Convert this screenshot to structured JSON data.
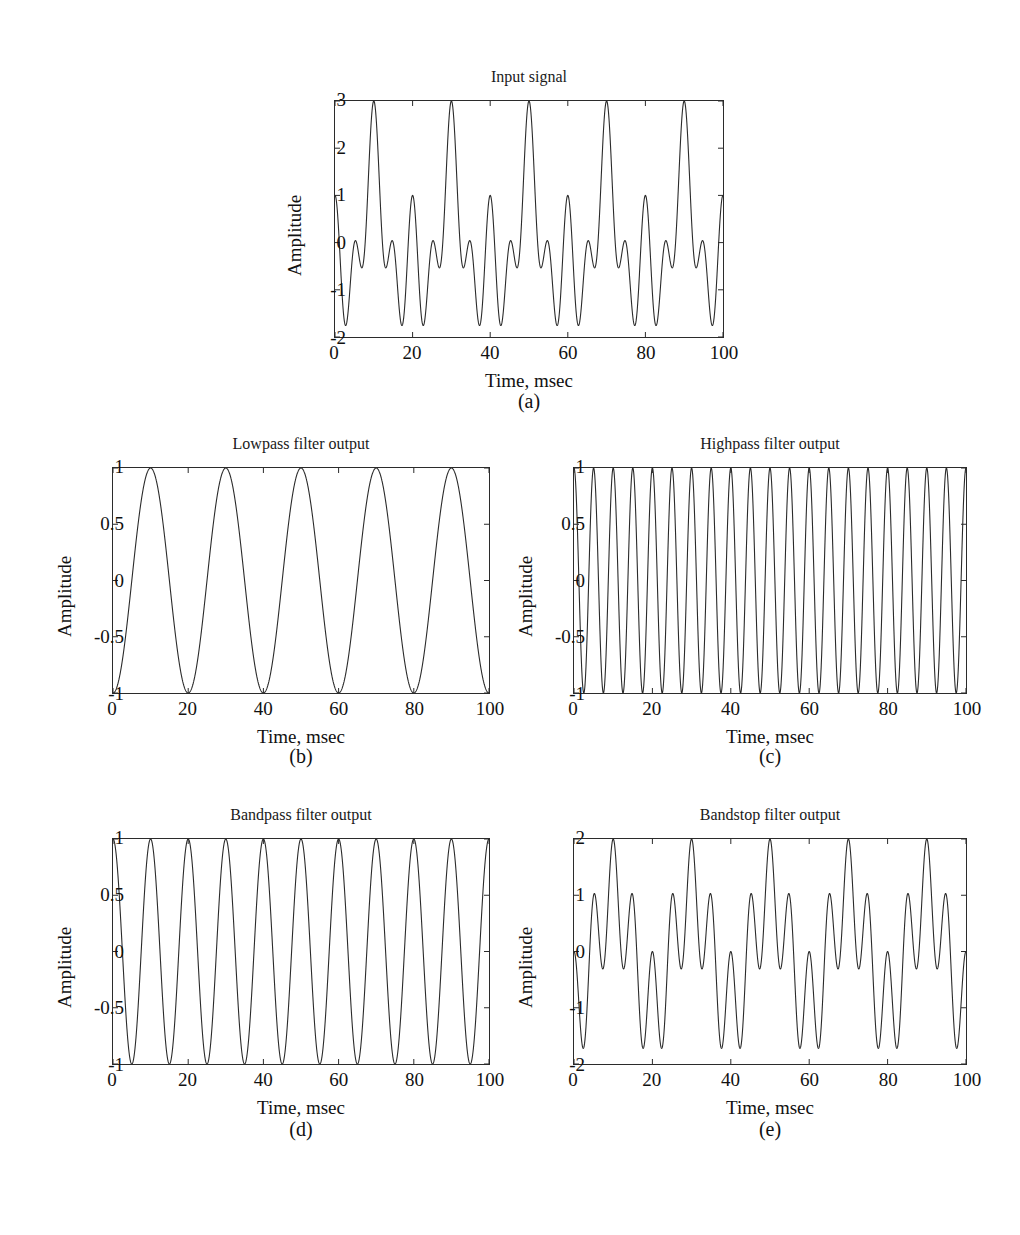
{
  "figure": {
    "width": 1020,
    "height": 1235,
    "background": "#ffffff",
    "line_color": "#2b2b2b",
    "text_color": "#111111"
  },
  "panels": [
    {
      "id": "input-signal",
      "caption": "(a)",
      "title": "Input signal",
      "xlabel": "Time, msec",
      "ylabel": "Amplitude",
      "xticks": [
        "0",
        "20",
        "40",
        "60",
        "80",
        "100"
      ],
      "yticks": [
        "-2",
        "-1",
        "0",
        "1",
        "2",
        "3"
      ]
    },
    {
      "id": "lowpass-output",
      "caption": "(b)",
      "title": "Lowpass filter output",
      "xlabel": "Time, msec",
      "ylabel": "Amplitude",
      "xticks": [
        "0",
        "20",
        "40",
        "60",
        "80",
        "100"
      ],
      "yticks": [
        "-1",
        "-0.5",
        "0",
        "0.5",
        "1"
      ]
    },
    {
      "id": "highpass-output",
      "caption": "(c)",
      "title": "Highpass filter output",
      "xlabel": "Time, msec",
      "ylabel": "Amplitude",
      "xticks": [
        "0",
        "20",
        "40",
        "60",
        "80",
        "100"
      ],
      "yticks": [
        "-1",
        "-0.5",
        "0",
        "0.5",
        "1"
      ]
    },
    {
      "id": "bandpass-output",
      "caption": "(d)",
      "title": "Bandpass filter output",
      "xlabel": "Time, msec",
      "ylabel": "Amplitude",
      "xticks": [
        "0",
        "20",
        "40",
        "60",
        "80",
        "100"
      ],
      "yticks": [
        "-1",
        "-0.5",
        "0",
        "0.5",
        "1"
      ]
    },
    {
      "id": "bandstop-output",
      "caption": "(e)",
      "title": "Bandstop filter output",
      "xlabel": "Time, msec",
      "ylabel": "Amplitude",
      "xticks": [
        "0",
        "20",
        "40",
        "60",
        "80",
        "100"
      ],
      "yticks": [
        "-2",
        "-1",
        "0",
        "1",
        "2"
      ]
    }
  ],
  "chart_data": [
    {
      "type": "line",
      "id": "input-signal",
      "caption": "(a)",
      "title": "Input signal",
      "xlabel": "Time, msec",
      "ylabel": "Amplitude",
      "xlim": [
        0,
        100
      ],
      "ylim": [
        -2,
        3
      ],
      "xticks": [
        0,
        20,
        40,
        60,
        80,
        100
      ],
      "yticks": [
        -2,
        -1,
        0,
        1,
        2,
        3
      ],
      "grid": false,
      "legend": "none",
      "series": [
        {
          "name": "input",
          "description": "sum of three cosines: -cos(2*pi*50*t) + cos(2*pi*100*t) + cos(2*pi*200*t), t in seconds",
          "components": [
            {
              "amplitude": -1,
              "frequency_hz": 50,
              "phase_deg": 0
            },
            {
              "amplitude": 1,
              "frequency_hz": 100,
              "phase_deg": 0
            },
            {
              "amplitude": 1,
              "frequency_hz": 200,
              "phase_deg": 0
            }
          ],
          "value_at_t0": 1,
          "max_value": 3,
          "min_value": -1.732,
          "peak_times_msec": [
            10,
            30,
            50,
            70,
            90
          ]
        }
      ]
    },
    {
      "type": "line",
      "id": "lowpass-output",
      "caption": "(b)",
      "title": "Lowpass filter output",
      "xlabel": "Time, msec",
      "ylabel": "Amplitude",
      "xlim": [
        0,
        100
      ],
      "ylim": [
        -1,
        1
      ],
      "xticks": [
        0,
        20,
        40,
        60,
        80,
        100
      ],
      "yticks": [
        -1,
        -0.5,
        0,
        0.5,
        1
      ],
      "grid": false,
      "legend": "none",
      "series": [
        {
          "name": "lowpass",
          "description": "-cos(2*pi*50*t), t in seconds",
          "components": [
            {
              "amplitude": -1,
              "frequency_hz": 50,
              "phase_deg": 0
            }
          ],
          "value_at_t0": -1,
          "max_value": 1,
          "min_value": -1,
          "cycles_over_window": 5,
          "peak_times_msec": [
            10,
            30,
            50,
            70,
            90
          ]
        }
      ]
    },
    {
      "type": "line",
      "id": "highpass-output",
      "caption": "(c)",
      "title": "Highpass filter output",
      "xlabel": "Time, msec",
      "ylabel": "Amplitude",
      "xlim": [
        0,
        100
      ],
      "ylim": [
        -1,
        1
      ],
      "xticks": [
        0,
        20,
        40,
        60,
        80,
        100
      ],
      "yticks": [
        -1,
        -0.5,
        0,
        0.5,
        1
      ],
      "grid": false,
      "legend": "none",
      "series": [
        {
          "name": "highpass",
          "description": "cos(2*pi*200*t), t in seconds",
          "components": [
            {
              "amplitude": 1,
              "frequency_hz": 200,
              "phase_deg": 0
            }
          ],
          "value_at_t0": 1,
          "max_value": 1,
          "min_value": -1,
          "cycles_over_window": 20
        }
      ]
    },
    {
      "type": "line",
      "id": "bandpass-output",
      "caption": "(d)",
      "title": "Bandpass filter output",
      "xlabel": "Time, msec",
      "ylabel": "Amplitude",
      "xlim": [
        0,
        100
      ],
      "ylim": [
        -1,
        1
      ],
      "xticks": [
        0,
        20,
        40,
        60,
        80,
        100
      ],
      "yticks": [
        -1,
        -0.5,
        0,
        0.5,
        1
      ],
      "grid": false,
      "legend": "none",
      "series": [
        {
          "name": "bandpass",
          "description": "cos(2*pi*100*t), t in seconds",
          "components": [
            {
              "amplitude": 1,
              "frequency_hz": 100,
              "phase_deg": 0
            }
          ],
          "value_at_t0": 1,
          "max_value": 1,
          "min_value": -1,
          "cycles_over_window": 10
        }
      ]
    },
    {
      "type": "line",
      "id": "bandstop-output",
      "caption": "(e)",
      "title": "Bandstop filter output",
      "xlabel": "Time, msec",
      "ylabel": "Amplitude",
      "xlim": [
        0,
        100
      ],
      "ylim": [
        -2,
        2
      ],
      "xticks": [
        0,
        20,
        40,
        60,
        80,
        100
      ],
      "yticks": [
        -2,
        -1,
        0,
        1,
        2
      ],
      "grid": false,
      "legend": "none",
      "series": [
        {
          "name": "bandstop",
          "description": "-cos(2*pi*50*t) + cos(2*pi*200*t), t in seconds",
          "components": [
            {
              "amplitude": -1,
              "frequency_hz": 50,
              "phase_deg": 0
            },
            {
              "amplitude": 1,
              "frequency_hz": 200,
              "phase_deg": 0
            }
          ],
          "value_at_t0": 0,
          "max_value": 2,
          "min_value": -1.75,
          "peak_times_msec": [
            10,
            30,
            50,
            70,
            90
          ]
        }
      ]
    }
  ]
}
